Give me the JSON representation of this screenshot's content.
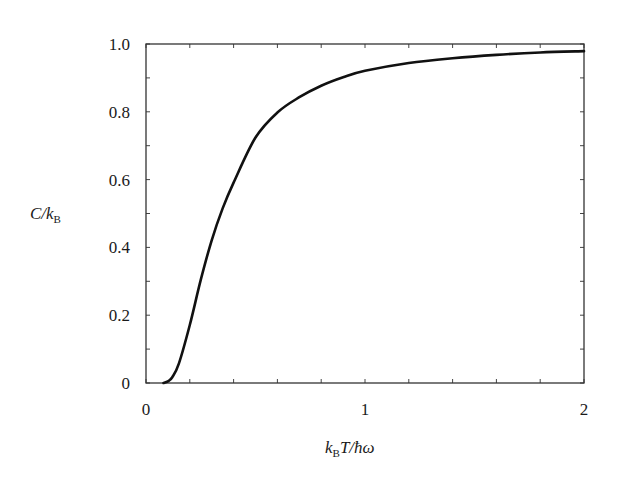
{
  "chart_data": {
    "type": "line",
    "title": "",
    "xlabel": "k_B T / ħω",
    "ylabel": "C / k_B",
    "xlim": [
      0,
      2
    ],
    "ylim": [
      0,
      1.0
    ],
    "grid": false,
    "legend": null,
    "x_ticks": [
      {
        "value": 0,
        "label": "0"
      },
      {
        "value": 1,
        "label": "1"
      },
      {
        "value": 2,
        "label": "2"
      }
    ],
    "x_minor_step": 0.2,
    "y_ticks": [
      {
        "value": 0,
        "label": "0"
      },
      {
        "value": 0.2,
        "label": "0.2"
      },
      {
        "value": 0.4,
        "label": "0.4"
      },
      {
        "value": 0.6,
        "label": "0.6"
      },
      {
        "value": 0.8,
        "label": "0.8"
      },
      {
        "value": 1.0,
        "label": "1.0"
      }
    ],
    "y_minor_step": 0.1,
    "series": [
      {
        "name": "Einstein heat capacity",
        "color": "#111111",
        "x": [
          0.08,
          0.1,
          0.12,
          0.15,
          0.2,
          0.25,
          0.3,
          0.35,
          0.4,
          0.5,
          0.6,
          0.7,
          0.8,
          0.9,
          1.0,
          1.2,
          1.4,
          1.6,
          1.8,
          2.0
        ],
        "values": [
          0.0,
          0.005,
          0.017,
          0.057,
          0.171,
          0.304,
          0.421,
          0.515,
          0.591,
          0.724,
          0.798,
          0.843,
          0.877,
          0.902,
          0.921,
          0.944,
          0.958,
          0.968,
          0.975,
          0.979
        ]
      }
    ]
  },
  "axes": {
    "xlabel_main": "k",
    "xlabel_sub": "B",
    "xlabel_rest": "T/ħω",
    "ylabel_main": "C/k",
    "ylabel_sub": "B"
  }
}
